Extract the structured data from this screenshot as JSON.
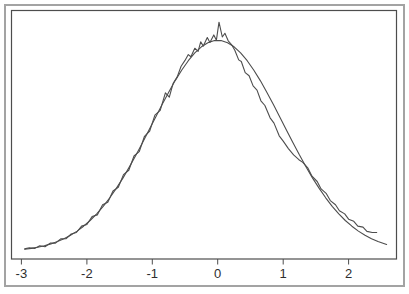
{
  "figure": {
    "background_color": "#ffffff",
    "frame_color": "#a3a3a3",
    "box_color": "#4d4d4d",
    "text_color": "#2e2e2e"
  },
  "chart_data": {
    "type": "line",
    "title": "",
    "subtitle": "",
    "xlabel": "",
    "ylabel": "",
    "grid": false,
    "legend": null,
    "xlim": [
      -3.152,
      2.732
    ],
    "ylim": [
      -0.013,
      0.455
    ],
    "x_ticks": [
      {
        "value": -3,
        "label": "-3"
      },
      {
        "value": -2,
        "label": "-2"
      },
      {
        "value": -1,
        "label": "-1"
      },
      {
        "value": 0,
        "label": "0"
      },
      {
        "value": 1,
        "label": "1"
      },
      {
        "value": 2,
        "label": "2"
      }
    ],
    "y_ticks": [],
    "series": [
      {
        "name": "empirical-density",
        "style": "jagged",
        "color": "#4d4d4d",
        "points": [
          [
            -2.95,
            0.006
          ],
          [
            -2.88,
            0.008
          ],
          [
            -2.8,
            0.007
          ],
          [
            -2.72,
            0.012
          ],
          [
            -2.64,
            0.01
          ],
          [
            -2.56,
            0.017
          ],
          [
            -2.48,
            0.017
          ],
          [
            -2.4,
            0.025
          ],
          [
            -2.32,
            0.025
          ],
          [
            -2.24,
            0.034
          ],
          [
            -2.16,
            0.037
          ],
          [
            -2.08,
            0.049
          ],
          [
            -2.0,
            0.052
          ],
          [
            -1.92,
            0.067
          ],
          [
            -1.84,
            0.07
          ],
          [
            -1.76,
            0.089
          ],
          [
            -1.68,
            0.094
          ],
          [
            -1.6,
            0.115
          ],
          [
            -1.52,
            0.122
          ],
          [
            -1.44,
            0.146
          ],
          [
            -1.36,
            0.154
          ],
          [
            -1.28,
            0.181
          ],
          [
            -1.2,
            0.189
          ],
          [
            -1.12,
            0.218
          ],
          [
            -1.04,
            0.228
          ],
          [
            -0.96,
            0.258
          ],
          [
            -0.88,
            0.267
          ],
          [
            -0.8,
            0.3
          ],
          [
            -0.74,
            0.292
          ],
          [
            -0.68,
            0.318
          ],
          [
            -0.62,
            0.33
          ],
          [
            -0.56,
            0.35
          ],
          [
            -0.5,
            0.361
          ],
          [
            -0.45,
            0.372
          ],
          [
            -0.41,
            0.368
          ],
          [
            -0.35,
            0.384
          ],
          [
            -0.3,
            0.378
          ],
          [
            -0.26,
            0.396
          ],
          [
            -0.22,
            0.388
          ],
          [
            -0.16,
            0.404
          ],
          [
            -0.12,
            0.395
          ],
          [
            -0.06,
            0.409
          ],
          [
            -0.02,
            0.399
          ],
          [
            0.02,
            0.433
          ],
          [
            0.07,
            0.405
          ],
          [
            0.11,
            0.412
          ],
          [
            0.16,
            0.398
          ],
          [
            0.21,
            0.391
          ],
          [
            0.26,
            0.38
          ],
          [
            0.32,
            0.362
          ],
          [
            0.36,
            0.359
          ],
          [
            0.42,
            0.338
          ],
          [
            0.48,
            0.332
          ],
          [
            0.54,
            0.313
          ],
          [
            0.6,
            0.305
          ],
          [
            0.66,
            0.285
          ],
          [
            0.72,
            0.276
          ],
          [
            0.8,
            0.253
          ],
          [
            0.86,
            0.243
          ],
          [
            0.94,
            0.219
          ],
          [
            1.0,
            0.209
          ],
          [
            1.08,
            0.195
          ],
          [
            1.16,
            0.183
          ],
          [
            1.24,
            0.174
          ],
          [
            1.3,
            0.169
          ],
          [
            1.38,
            0.158
          ],
          [
            1.44,
            0.143
          ],
          [
            1.52,
            0.133
          ],
          [
            1.58,
            0.119
          ],
          [
            1.66,
            0.11
          ],
          [
            1.72,
            0.097
          ],
          [
            1.8,
            0.089
          ],
          [
            1.86,
            0.078
          ],
          [
            1.94,
            0.072
          ],
          [
            2.0,
            0.062
          ],
          [
            2.08,
            0.058
          ],
          [
            2.14,
            0.049
          ],
          [
            2.22,
            0.047
          ],
          [
            2.28,
            0.039
          ],
          [
            2.36,
            0.037
          ],
          [
            2.43,
            0.037
          ]
        ]
      },
      {
        "name": "normal-density",
        "style": "smooth",
        "color": "#4d4d4d",
        "points": [
          [
            -2.95,
            0.0052
          ],
          [
            -2.85,
            0.0069
          ],
          [
            -2.75,
            0.0091
          ],
          [
            -2.65,
            0.0119
          ],
          [
            -2.55,
            0.0154
          ],
          [
            -2.45,
            0.0198
          ],
          [
            -2.35,
            0.0252
          ],
          [
            -2.25,
            0.0317
          ],
          [
            -2.15,
            0.0395
          ],
          [
            -2.05,
            0.0488
          ],
          [
            -1.95,
            0.0596
          ],
          [
            -1.85,
            0.0721
          ],
          [
            -1.75,
            0.0863
          ],
          [
            -1.65,
            0.1023
          ],
          [
            -1.55,
            0.12
          ],
          [
            -1.45,
            0.1394
          ],
          [
            -1.35,
            0.1604
          ],
          [
            -1.25,
            0.1826
          ],
          [
            -1.15,
            0.2059
          ],
          [
            -1.05,
            0.2299
          ],
          [
            -0.95,
            0.254
          ],
          [
            -0.85,
            0.278
          ],
          [
            -0.75,
            0.3011
          ],
          [
            -0.65,
            0.3229
          ],
          [
            -0.55,
            0.3429
          ],
          [
            -0.45,
            0.3605
          ],
          [
            -0.35,
            0.3752
          ],
          [
            -0.25,
            0.3866
          ],
          [
            -0.15,
            0.3944
          ],
          [
            -0.05,
            0.3984
          ],
          [
            0.05,
            0.3984
          ],
          [
            0.15,
            0.3944
          ],
          [
            0.25,
            0.3866
          ],
          [
            0.35,
            0.3752
          ],
          [
            0.45,
            0.3605
          ],
          [
            0.55,
            0.3429
          ],
          [
            0.65,
            0.3229
          ],
          [
            0.75,
            0.3011
          ],
          [
            0.85,
            0.278
          ],
          [
            0.95,
            0.254
          ],
          [
            1.05,
            0.2299
          ],
          [
            1.15,
            0.2059
          ],
          [
            1.25,
            0.1826
          ],
          [
            1.35,
            0.1604
          ],
          [
            1.45,
            0.1394
          ],
          [
            1.55,
            0.12
          ],
          [
            1.65,
            0.1023
          ],
          [
            1.75,
            0.0863
          ],
          [
            1.85,
            0.0721
          ],
          [
            1.95,
            0.0596
          ],
          [
            2.05,
            0.0488
          ],
          [
            2.15,
            0.0395
          ],
          [
            2.25,
            0.0317
          ],
          [
            2.35,
            0.0252
          ],
          [
            2.45,
            0.0198
          ],
          [
            2.58,
            0.0143
          ]
        ]
      }
    ]
  }
}
